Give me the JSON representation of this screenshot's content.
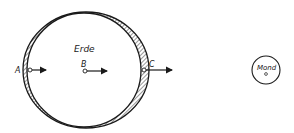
{
  "diagram": {
    "type": "tidal-bulge-schematic",
    "colors": {
      "stroke": "#1a1a1a",
      "background": "#ffffff",
      "hatch": "#333333"
    },
    "earth": {
      "label": "Erde",
      "inner_circle": {
        "cx": 84,
        "cy": 70,
        "r": 57
      },
      "outer_bulge": {
        "cx": 86,
        "cy": 70,
        "rx": 63,
        "ry": 58
      }
    },
    "moon": {
      "label": "Mond",
      "circle": {
        "cx": 266,
        "cy": 70,
        "r": 14
      }
    },
    "points": [
      {
        "id": "A",
        "label": "A",
        "x": 30,
        "y": 70,
        "arrow_to": 46
      },
      {
        "id": "B",
        "label": "B",
        "x": 85,
        "y": 71,
        "arrow_to": 107
      },
      {
        "id": "C",
        "label": "C",
        "x": 144,
        "y": 70,
        "arrow_to": 172
      }
    ]
  }
}
